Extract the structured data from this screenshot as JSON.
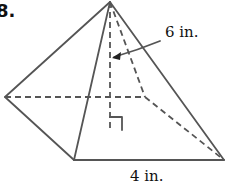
{
  "problem": {
    "number": "8."
  },
  "figure": {
    "type": "square pyramid",
    "labels": {
      "height": "6 in.",
      "base_edge": "4 in."
    },
    "colors": {
      "line": "#555555",
      "text": "#111111"
    }
  }
}
